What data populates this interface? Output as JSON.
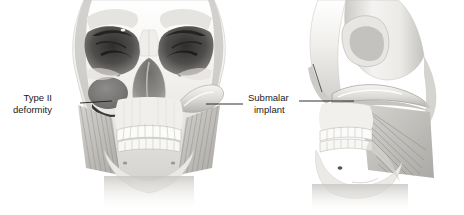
{
  "figure": {
    "kind": "medical-illustration",
    "background_color": "#ffffff",
    "palette": {
      "bone_light": "#f2f1ef",
      "bone_mid": "#d8d6d2",
      "bone_shadow": "#a9a7a3",
      "bone_deep_shadow": "#6e6c69",
      "orbit_dark": "#4a4846",
      "deformity_fill": "#7d7b79",
      "implant_fill": "#cfcdc9",
      "muscle": "#bcbab6",
      "tooth": "#fbfbf9",
      "tooth_outline": "#b5b3af",
      "leader_line": "#1a1a1a",
      "text": "#1a1a1a"
    },
    "views": [
      {
        "name": "frontal-skull-view",
        "position": "left",
        "description": "Anterior view of skull showing orbits, nasal aperture, maxilla, mandible and masseter muscles"
      },
      {
        "name": "lateral-skull-view",
        "position": "right",
        "description": "Right lateral oblique view of skull showing zygomatic arch, maxilla, mandible and masseter muscle"
      }
    ]
  },
  "annotations": [
    {
      "id": "type-ii-deformity",
      "line1": "Type II",
      "line2": "deformity",
      "text_x": 52,
      "text_y": 101,
      "leader": {
        "x1": 80,
        "y1": 103,
        "x2": 112,
        "y2": 101
      },
      "points_to": "midfacial hollow on frontal view left cheek"
    },
    {
      "id": "submalar-implant",
      "line1": "Submalar",
      "line2": "implant",
      "text_x": 281,
      "text_y": 101,
      "leader_left": {
        "x1": 206,
        "y1": 104,
        "x2": 243,
        "y2": 104
      },
      "leader_right": {
        "x1": 299,
        "y1": 101,
        "x2": 354,
        "y2": 101
      },
      "points_to": "submalar implant on frontal right cheek and lateral view"
    }
  ]
}
